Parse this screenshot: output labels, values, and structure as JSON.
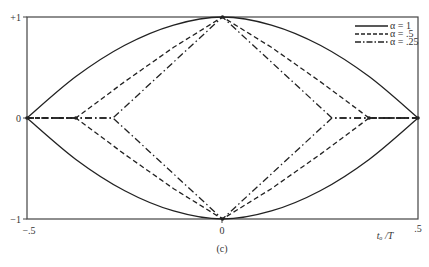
{
  "chart_data": {
    "type": "line",
    "title": "",
    "caption": "(c)",
    "xlabel": "t_o /T",
    "ylabel": "",
    "xlim": [
      -0.5,
      0.5
    ],
    "ylim": [
      -1,
      1
    ],
    "x_ticks": [
      "-.5",
      "0",
      ".5"
    ],
    "y_ticks": [
      "+1",
      "0",
      "-1"
    ],
    "grid": false,
    "legend_position": "upper right",
    "series": [
      {
        "name": "α = 1",
        "style": "solid",
        "upper": {
          "x": [
            -0.5,
            -0.375,
            -0.25,
            -0.125,
            0,
            0.125,
            0.25,
            0.375,
            0.5
          ],
          "y": [
            0,
            0.41,
            0.72,
            0.92,
            1,
            0.92,
            0.72,
            0.41,
            0
          ]
        },
        "lower": {
          "x": [
            -0.5,
            -0.375,
            -0.25,
            -0.125,
            0,
            0.125,
            0.25,
            0.375,
            0.5
          ],
          "y": [
            0,
            -0.41,
            -0.72,
            -0.92,
            -1,
            -0.92,
            -0.72,
            -0.41,
            0
          ]
        }
      },
      {
        "name": "α = .5",
        "style": "dashed",
        "upper": {
          "x": [
            -0.5,
            -0.375,
            -0.25,
            -0.125,
            0,
            0.125,
            0.25,
            0.375,
            0.5
          ],
          "y": [
            0,
            0,
            0.36,
            0.7,
            1,
            0.7,
            0.36,
            0,
            0
          ]
        },
        "lower": {
          "x": [
            -0.5,
            -0.375,
            -0.25,
            -0.125,
            0,
            0.125,
            0.25,
            0.375,
            0.5
          ],
          "y": [
            0,
            0,
            -0.36,
            -0.7,
            -1,
            -0.7,
            -0.36,
            0,
            0
          ]
        }
      },
      {
        "name": "α = .25",
        "style": "dash-dot",
        "upper": {
          "x": [
            -0.5,
            -0.28,
            -0.14,
            0,
            0.14,
            0.28,
            0.5
          ],
          "y": [
            0,
            0,
            0.5,
            1,
            0.5,
            0,
            0
          ]
        },
        "lower": {
          "x": [
            -0.5,
            -0.28,
            -0.14,
            0,
            0.14,
            0.28,
            0.5
          ],
          "y": [
            0,
            0,
            -0.5,
            -1,
            -0.5,
            0,
            0
          ]
        }
      }
    ]
  },
  "labels": {
    "y_top": "+1",
    "y_mid": "0",
    "y_bot": "−1",
    "x_left": "−.5",
    "x_mid": "0",
    "x_right": ".5",
    "x_axis_label": "tₒ /T",
    "caption": "(c)",
    "legend": [
      "α = 1",
      "α = .5",
      "α = .25"
    ]
  }
}
